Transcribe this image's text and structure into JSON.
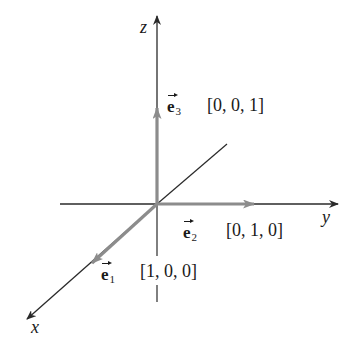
{
  "diagram": {
    "axes": {
      "x": {
        "label": "x"
      },
      "y": {
        "label": "y"
      },
      "z": {
        "label": "z"
      }
    },
    "vectors": [
      {
        "name": "e",
        "subscript": "1",
        "coords": "[1, 0, 0]",
        "axis": "x"
      },
      {
        "name": "e",
        "subscript": "2",
        "coords": "[0, 1, 0]",
        "axis": "y"
      },
      {
        "name": "e",
        "subscript": "3",
        "coords": "[0, 0, 1]",
        "axis": "z"
      }
    ],
    "colors": {
      "axis": "#2a2a2a",
      "vector": "#8c8c8c",
      "background": "#ffffff"
    }
  }
}
